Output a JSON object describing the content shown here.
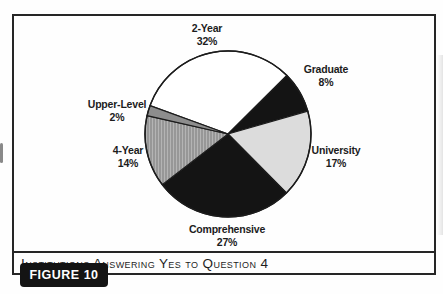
{
  "figure": {
    "caption": "Institutions Answering Yes to Question 4",
    "figure_label": "FIGURE 10"
  },
  "chart_data": {
    "type": "pie",
    "title": "Institutions Answering Yes to Question 4",
    "units": "percent",
    "start_angle_deg": 160,
    "direction": "clockwise",
    "legend_position": "none",
    "labels_style": "outside-two-line",
    "center": {
      "x": 228,
      "y": 134
    },
    "radius": 83,
    "stroke_color": "#1c1c1c",
    "pattern_colors": {
      "stripe_base": "#b4b4b4",
      "stripe_line": "#7a7a7a"
    },
    "slices": [
      {
        "label": "2-Year",
        "value_pct": 32,
        "fill": "#ffffff",
        "pattern": "solid",
        "label_x": 207,
        "label_y": 22
      },
      {
        "label": "Graduate",
        "value_pct": 8,
        "fill": "#141414",
        "pattern": "solid",
        "label_x": 326,
        "label_y": 63
      },
      {
        "label": "University",
        "value_pct": 17,
        "fill": "#dcdcdc",
        "pattern": "solid",
        "label_x": 336,
        "label_y": 144
      },
      {
        "label": "Comprehensive",
        "value_pct": 27,
        "fill": "#141414",
        "pattern": "solid",
        "label_x": 227,
        "label_y": 223
      },
      {
        "label": "4-Year",
        "value_pct": 14,
        "fill": "#b4b4b4",
        "pattern": "vertical-stripes",
        "label_x": 128,
        "label_y": 144
      },
      {
        "label": "Upper-Level",
        "value_pct": 2,
        "fill": "#8d8d8d",
        "pattern": "solid",
        "label_x": 117,
        "label_y": 98
      }
    ]
  }
}
